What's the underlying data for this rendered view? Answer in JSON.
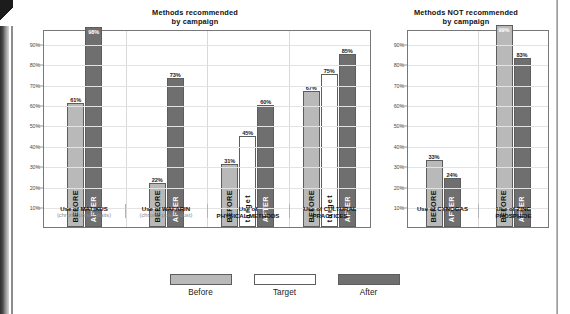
{
  "chart_data": [
    {
      "type": "bar",
      "title": "Methods recommended by campaign",
      "title_line1": "Methods recommended",
      "title_line2": "by campaign",
      "xlabel": "",
      "ylabel": "",
      "ylim": [
        0,
        97
      ],
      "grid": true,
      "yticks": [
        90,
        80,
        70,
        60,
        50,
        40,
        30,
        20,
        10
      ],
      "ytick_labels": [
        "90%",
        "80%",
        "70%",
        "60%",
        "50%",
        "40%",
        "30%",
        "20%",
        "10%"
      ],
      "legend_position": "bottom",
      "categories": [
        {
          "main": "Use of MATIKUS",
          "sub": "(chronic poison baits)"
        },
        {
          "main": "Use of WAFARIN",
          "sub": "(chronic poison dust)"
        },
        {
          "main": "Use of PHYSICAL METHODS",
          "sub": ""
        },
        {
          "main": "Use of CULTURAL PRACTICES",
          "sub": ""
        }
      ],
      "series": [
        {
          "name": "Before",
          "label": "BEFORE",
          "color": "#b9b9b9",
          "values": [
            61,
            22,
            31,
            67
          ]
        },
        {
          "name": "Target",
          "label": "target",
          "color": "#ffffff",
          "values": [
            null,
            null,
            45,
            75
          ]
        },
        {
          "name": "After",
          "label": "AFTER",
          "color": "#6f6f6f",
          "values": [
            98,
            73,
            60,
            85
          ]
        }
      ],
      "value_labels": [
        "61%",
        "98%",
        "22%",
        "73%",
        "31%",
        "45%",
        "60%",
        "67%",
        "75%",
        "85%"
      ]
    },
    {
      "type": "bar",
      "title": "Methods NOT recommended by campaign",
      "title_line1": "Methods NOT recommended",
      "title_line2": "by campaign",
      "xlabel": "",
      "ylabel": "",
      "ylim": [
        0,
        97
      ],
      "grid": true,
      "yticks": [
        90,
        80,
        70,
        60,
        50,
        40,
        30,
        20,
        10
      ],
      "ytick_labels": [
        "90%",
        "80%",
        "70%",
        "60%",
        "50%",
        "40%",
        "30%",
        "20%",
        "10%"
      ],
      "legend_position": "bottom",
      "categories": [
        {
          "main": "Use of CYNOGAS",
          "sub": ""
        },
        {
          "main": "Use of ZINC PHOSPHIDE",
          "sub": ""
        }
      ],
      "series": [
        {
          "name": "Before",
          "label": "BEFORE",
          "color": "#b9b9b9",
          "values": [
            33,
            99
          ]
        },
        {
          "name": "After",
          "label": "AFTER",
          "color": "#6f6f6f",
          "values": [
            24,
            83
          ]
        }
      ],
      "value_labels": [
        "33%",
        "24%",
        "99%",
        "83%"
      ]
    }
  ],
  "charts": {
    "left": {
      "title_line1": "Methods recommended",
      "title_line2": "by campaign",
      "yticks": [
        "90%",
        "80%",
        "70%",
        "60%",
        "50%",
        "40%",
        "30%",
        "20%",
        "10%"
      ],
      "groups": [
        {
          "cat_main": "Use of MATIKUS",
          "cat_sub": "(chronic poison baits)",
          "bars": [
            {
              "series": "before",
              "value": 61,
              "value_label": "61%",
              "bar_label": "BEFORE",
              "label_pos": "outside"
            },
            {
              "series": "after",
              "value": 98,
              "value_label": "98%",
              "bar_label": "AFTER",
              "label_pos": "inside"
            }
          ]
        },
        {
          "cat_main": "Use of WAFARIN",
          "cat_sub": "(chronic poison dust)",
          "bars": [
            {
              "series": "before",
              "value": 22,
              "value_label": "22%",
              "bar_label": "BEFORE",
              "label_pos": "outside"
            },
            {
              "series": "after",
              "value": 73,
              "value_label": "73%",
              "bar_label": "AFTER",
              "label_pos": "outside"
            }
          ]
        },
        {
          "cat_main": "Use of",
          "cat_sub2": "PHYSICAL METHODS",
          "cat_sub": "",
          "bars": [
            {
              "series": "before",
              "value": 31,
              "value_label": "31%",
              "bar_label": "BEFORE",
              "label_pos": "outside"
            },
            {
              "series": "target",
              "value": 45,
              "value_label": "45%",
              "bar_label": "target",
              "label_pos": "outside"
            },
            {
              "series": "after",
              "value": 60,
              "value_label": "60%",
              "bar_label": "AFTER",
              "label_pos": "outside"
            }
          ]
        },
        {
          "cat_main": "Use of CULTURAL",
          "cat_sub2": "PRACTICES",
          "cat_sub": "",
          "bars": [
            {
              "series": "before",
              "value": 67,
              "value_label": "67%",
              "bar_label": "BEFORE",
              "label_pos": "outside"
            },
            {
              "series": "target",
              "value": 75,
              "value_label": "75%",
              "bar_label": "target",
              "label_pos": "outside"
            },
            {
              "series": "after",
              "value": 85,
              "value_label": "85%",
              "bar_label": "AFTER",
              "label_pos": "outside"
            }
          ]
        }
      ]
    },
    "right": {
      "title_line1": "Methods NOT recommended",
      "title_line2": "by campaign",
      "yticks": [
        "90%",
        "80%",
        "70%",
        "60%",
        "50%",
        "40%",
        "30%",
        "20%",
        "10%"
      ],
      "groups": [
        {
          "cat_main": "Use of CYNOGAS",
          "cat_sub": "",
          "bars": [
            {
              "series": "before",
              "value": 33,
              "value_label": "33%",
              "bar_label": "BEFORE",
              "label_pos": "outside"
            },
            {
              "series": "after",
              "value": 24,
              "value_label": "24%",
              "bar_label": "AFTER",
              "label_pos": "outside"
            }
          ]
        },
        {
          "cat_main": "Use of ZINC",
          "cat_sub2": "PHOSPHIDE",
          "cat_sub": "",
          "bars": [
            {
              "series": "before",
              "value": 99,
              "value_label": "99%",
              "bar_label": "BEFORE",
              "label_pos": "inside"
            },
            {
              "series": "after",
              "value": 83,
              "value_label": "83%",
              "bar_label": "AFTER",
              "label_pos": "outside"
            }
          ]
        }
      ]
    }
  },
  "legend": {
    "items": [
      {
        "label": "Before",
        "series": "before",
        "color": "#b9b9b9"
      },
      {
        "label": "Target",
        "series": "target",
        "color": "#ffffff"
      },
      {
        "label": "After",
        "series": "after",
        "color": "#6f6f6f"
      }
    ]
  },
  "colors": {
    "before": "#b9b9b9",
    "target": "#ffffff",
    "after": "#6f6f6f",
    "axis": "#777777",
    "grid": "#e3e3e3",
    "text": "#111111",
    "subtext": "#8a8a8a"
  }
}
